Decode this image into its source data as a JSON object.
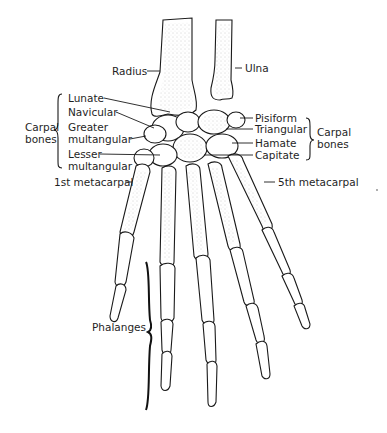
{
  "figure": {
    "labels": {
      "radius": "Radius",
      "ulna": "Ulna",
      "lunate": "Lunate",
      "navicular": "Navicular",
      "greater_multangular_1": "Greater",
      "greater_multangular_2": "multangular",
      "lesser_multangular_1": "Lesser",
      "lesser_multangular_2": "multangular",
      "carpal_left_1": "Carpal",
      "carpal_left_2": "bones",
      "first_metacarpal": "1st metacarpal",
      "pisiform": "Pisiform",
      "triangular": "Triangular",
      "hamate": "Hamate",
      "capitate": "Capitate",
      "carpal_right_1": "Carpal",
      "carpal_right_2": "bones",
      "fifth_metacarpal": "5th metacarpal",
      "phalanges": "Phalanges"
    },
    "colors": {
      "ink": "#1a1a1a",
      "background": "#ffffff",
      "stipple": "#9a9a9a"
    }
  }
}
